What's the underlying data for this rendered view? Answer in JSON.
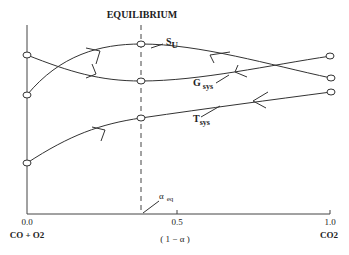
{
  "title": "EQUILIBRIUM",
  "x_axis": {
    "ticks": [
      "0.0",
      "0.5",
      "1.0"
    ],
    "label": "( 1  −  α )",
    "left_end_label": "CO + O2",
    "right_end_label": "CO2"
  },
  "equilibrium_marker": {
    "symbol": "α",
    "subscript": "eq"
  },
  "curves": [
    {
      "name": "S",
      "subscript": "U"
    },
    {
      "name": "G",
      "subscript": "sys"
    },
    {
      "name": "T",
      "subscript": "sys"
    }
  ],
  "colors": {
    "line": "#333333",
    "background": "#ffffff"
  }
}
